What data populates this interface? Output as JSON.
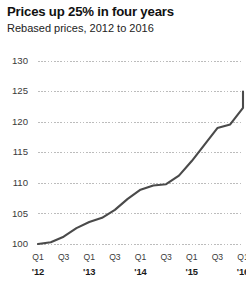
{
  "chart_data": {
    "type": "line",
    "title": "Prices up 25% in four years",
    "subtitle": "Rebased prices, 2012 to 2016",
    "xlabel": "",
    "ylabel": "",
    "ylim": [
      100,
      130
    ],
    "yticks": [
      100,
      105,
      110,
      115,
      120,
      125,
      130
    ],
    "ytick_labels": [
      "100",
      "105",
      "110",
      "115",
      "120",
      "125",
      "130"
    ],
    "grid": true,
    "grid_style": "dotted",
    "grid_color": "#bcbcbc",
    "legend": false,
    "line_color": "#4a4a4a",
    "line_width": 2.1,
    "x": [
      "Q1 '12",
      "Q2 '12",
      "Q3 '12",
      "Q4 '12",
      "Q1 '13",
      "Q2 '13",
      "Q3 '13",
      "Q4 '13",
      "Q1 '14",
      "Q2 '14",
      "Q3 '14",
      "Q4 '14",
      "Q1 '15",
      "Q2 '15",
      "Q3 '15",
      "Q4 '15",
      "Q1 '16"
    ],
    "xtick_quarters": [
      "Q1",
      "Q3",
      "Q1",
      "Q3",
      "Q1",
      "Q3",
      "Q1",
      "Q3",
      "Q1"
    ],
    "xtick_years": [
      "'12",
      "'13",
      "'14",
      "'15",
      "'16"
    ],
    "series": [
      {
        "name": "Rebased prices",
        "values": [
          100.0,
          100.3,
          101.2,
          102.6,
          103.6,
          104.3,
          105.6,
          107.4,
          108.9,
          109.6,
          109.8,
          111.2,
          113.6,
          116.3,
          119.0,
          119.6,
          122.3
        ]
      }
    ],
    "end_value": 125,
    "start_value": 100,
    "change_percent": "25%"
  }
}
